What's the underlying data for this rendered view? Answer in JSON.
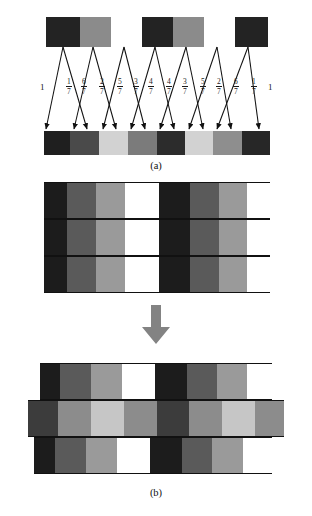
{
  "figure": {
    "caption_a": "(a)",
    "caption_b": "(b)"
  },
  "palette": {
    "black": "#1c1c1c",
    "very_dark": "#242424",
    "dark": "#3f3f3f",
    "mid_dark": "#555555",
    "mid": "#6e6e6e",
    "mid_light": "#8e8e8e",
    "light": "#b5b5b5",
    "very_light": "#d4d4d4",
    "near_white": "#ececec",
    "white": "#ffffff",
    "outline": "#111111",
    "arrow_gray": "#808080"
  },
  "panel_a": {
    "source_bar": {
      "label": "source-scanline",
      "cell_count": 7,
      "cells": [
        {
          "color": "#232323",
          "width": 34
        },
        {
          "color": "#8b8b8b",
          "width": 31
        },
        {
          "color": "#ffffff",
          "width": 31
        },
        {
          "color": "#232323",
          "width": 31
        },
        {
          "color": "#8b8b8b",
          "width": 31
        },
        {
          "color": "#ffffff",
          "width": 31
        },
        {
          "color": "#232323",
          "width": 33
        }
      ]
    },
    "weights": [
      {
        "text": "1",
        "type": "whole",
        "x": 40
      },
      {
        "text": "1/7",
        "type": "fraction",
        "numerator": "1",
        "denominator": "7",
        "x": 66
      },
      {
        "text": "6/7",
        "type": "fraction",
        "numerator": "6",
        "denominator": "7",
        "x": 81
      },
      {
        "text": "2/7",
        "type": "fraction",
        "numerator": "2",
        "denominator": "7",
        "x": 99
      },
      {
        "text": "5/7",
        "type": "fraction",
        "numerator": "5",
        "denominator": "7",
        "x": 117
      },
      {
        "text": "3/7",
        "type": "fraction",
        "numerator": "3",
        "denominator": "7",
        "x": 133
      },
      {
        "text": "4/7",
        "type": "fraction",
        "numerator": "4",
        "denominator": "7",
        "x": 148
      },
      {
        "text": "4/7",
        "type": "fraction",
        "numerator": "4",
        "denominator": "7",
        "x": 166
      },
      {
        "text": "3/7",
        "type": "fraction",
        "numerator": "3",
        "denominator": "7",
        "x": 182
      },
      {
        "text": "5/7",
        "type": "fraction",
        "numerator": "5",
        "denominator": "7",
        "x": 200
      },
      {
        "text": "2/7",
        "type": "fraction",
        "numerator": "2",
        "denominator": "7",
        "x": 216
      },
      {
        "text": "6/7",
        "type": "fraction",
        "numerator": "6",
        "denominator": "7",
        "x": 233
      },
      {
        "text": "1/7",
        "type": "fraction",
        "numerator": "1",
        "denominator": "7",
        "x": 251
      },
      {
        "text": "1",
        "type": "whole",
        "x": 268
      }
    ],
    "dest_bar": {
      "label": "destination-scanline",
      "cell_count": 8,
      "cells": [
        {
          "color": "#1f1f1f",
          "width": 26
        },
        {
          "color": "#4a4a4a",
          "width": 29
        },
        {
          "color": "#d2d2d2",
          "width": 29
        },
        {
          "color": "#7b7b7b",
          "width": 29
        },
        {
          "color": "#2c2c2c",
          "width": 28
        },
        {
          "color": "#d2d2d2",
          "width": 28
        },
        {
          "color": "#8e8e8e",
          "width": 29
        },
        {
          "color": "#272727",
          "width": 28
        }
      ]
    }
  },
  "panel_b": {
    "grid_block": {
      "label": "aligned-block",
      "row_count": 3,
      "cells": [
        {
          "color": "#1c1c1c",
          "width": 23
        },
        {
          "color": "#5a5a5a",
          "width": 29
        },
        {
          "color": "#9a9a9a",
          "width": 29
        },
        {
          "color": "#ffffff",
          "width": 34
        },
        {
          "color": "#1c1c1c",
          "width": 31
        },
        {
          "color": "#5a5a5a",
          "width": 29
        },
        {
          "color": "#9a9a9a",
          "width": 28
        },
        {
          "color": "#ffffff",
          "width": 23
        }
      ]
    },
    "transform_arrow": "down-arrow",
    "offset_rows": [
      {
        "label": "offset-row-top",
        "left": 40,
        "width": 232,
        "cells": [
          {
            "color": "#1c1c1c",
            "width": 20
          },
          {
            "color": "#5a5a5a",
            "width": 31
          },
          {
            "color": "#9a9a9a",
            "width": 31
          },
          {
            "color": "#ffffff",
            "width": 33
          },
          {
            "color": "#1c1c1c",
            "width": 32
          },
          {
            "color": "#5a5a5a",
            "width": 30
          },
          {
            "color": "#9a9a9a",
            "width": 30
          },
          {
            "color": "#ffffff",
            "width": 25
          }
        ]
      },
      {
        "label": "offset-row-middle",
        "left": 28,
        "width": 256,
        "cells": [
          {
            "color": "#3c3c3c",
            "width": 30
          },
          {
            "color": "#8c8c8c",
            "width": 33
          },
          {
            "color": "#c6c6c6",
            "width": 33
          },
          {
            "color": "#8c8c8c",
            "width": 33
          },
          {
            "color": "#3c3c3c",
            "width": 32
          },
          {
            "color": "#8c8c8c",
            "width": 33
          },
          {
            "color": "#c6c6c6",
            "width": 33
          },
          {
            "color": "#8c8c8c",
            "width": 29
          }
        ]
      },
      {
        "label": "offset-row-bottom",
        "left": 34,
        "width": 238,
        "cells": [
          {
            "color": "#1c1c1c",
            "width": 21
          },
          {
            "color": "#5a5a5a",
            "width": 31
          },
          {
            "color": "#9a9a9a",
            "width": 31
          },
          {
            "color": "#ffffff",
            "width": 33
          },
          {
            "color": "#1c1c1c",
            "width": 32
          },
          {
            "color": "#5a5a5a",
            "width": 30
          },
          {
            "color": "#9a9a9a",
            "width": 31
          },
          {
            "color": "#ffffff",
            "width": 29
          }
        ]
      }
    ]
  }
}
